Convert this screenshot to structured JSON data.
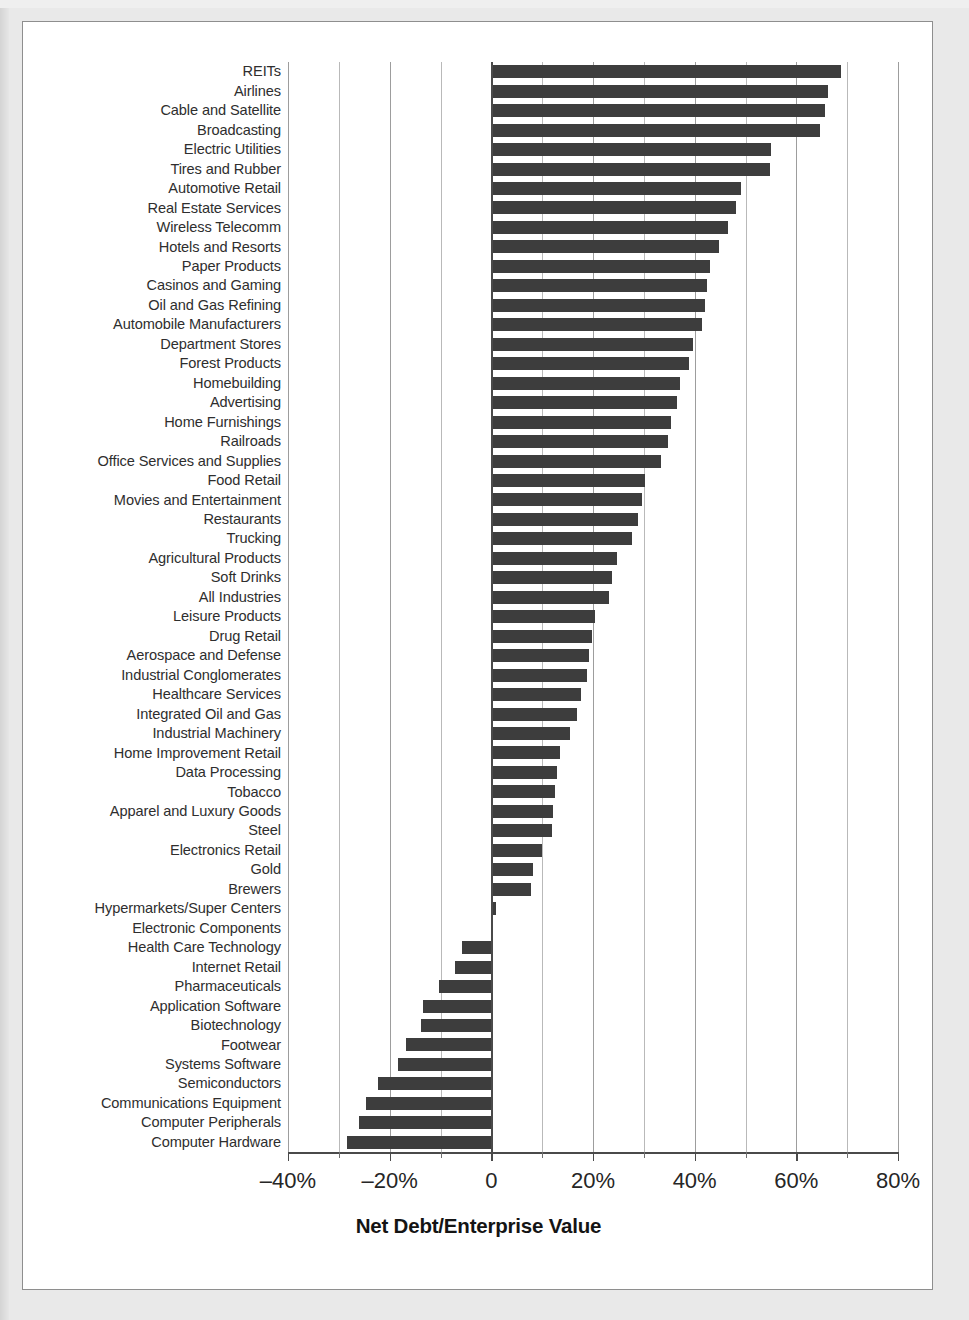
{
  "figure": {
    "axis_title": "Net Debt/Enterprise Value",
    "bar_color": "#3d3d3d",
    "frame_color": "#8e8e8e",
    "background": "#ffffff"
  },
  "chart_data": {
    "type": "bar",
    "orientation": "horizontal",
    "title": "",
    "xlabel": "Net Debt/Enterprise Value",
    "ylabel": "",
    "xlim": [
      -40,
      80
    ],
    "xticks": [
      -40,
      -20,
      0,
      20,
      40,
      60,
      80
    ],
    "xtick_labels": [
      "–40%",
      "–20%",
      "0",
      "20%",
      "40%",
      "60%",
      "80%"
    ],
    "minor_tick_interval": 10,
    "grid": true,
    "legend": null,
    "units": "percent",
    "categories": [
      "REITs",
      "Airlines",
      "Cable and Satellite",
      "Broadcasting",
      "Electric Utilities",
      "Tires and Rubber",
      "Automotive Retail",
      "Real Estate Services",
      "Wireless Telecomm",
      "Hotels and Resorts",
      "Paper Products",
      "Casinos and Gaming",
      "Oil and Gas Refining",
      "Automobile Manufacturers",
      "Department Stores",
      "Forest Products",
      "Homebuilding",
      "Advertising",
      "Home Furnishings",
      "Railroads",
      "Office Services and Supplies",
      "Food Retail",
      "Movies and Entertainment",
      "Restaurants",
      "Trucking",
      "Agricultural Products",
      "Soft Drinks",
      "All Industries",
      "Leisure Products",
      "Drug Retail",
      "Aerospace and Defense",
      "Industrial Conglomerates",
      "Healthcare Services",
      "Integrated Oil and Gas",
      "Industrial Machinery",
      "Home Improvement Retail",
      "Data Processing",
      "Tobacco",
      "Apparel and Luxury Goods",
      "Steel",
      "Electronics Retail",
      "Gold",
      "Brewers",
      "Hypermarkets/Super Centers",
      "Electronic Components",
      "Health Care Technology",
      "Internet Retail",
      "Pharmaceuticals",
      "Application Software",
      "Biotechnology",
      "Footwear",
      "Systems Software",
      "Semiconductors",
      "Communications Equipment",
      "Computer Peripherals",
      "Computer Hardware"
    ],
    "values": [
      68.8,
      66.3,
      65.6,
      64.6,
      55.1,
      54.9,
      49.2,
      48.2,
      46.5,
      44.7,
      43.1,
      42.5,
      42.1,
      41.5,
      39.6,
      38.8,
      37.2,
      36.6,
      35.4,
      34.8,
      33.4,
      30.3,
      29.6,
      28.9,
      27.6,
      24.8,
      23.7,
      23.1,
      20.3,
      19.8,
      19.3,
      18.9,
      17.6,
      16.9,
      15.4,
      13.5,
      13.0,
      12.6,
      12.2,
      11.9,
      9.9,
      8.1,
      7.8,
      1.0,
      0.4,
      -5.7,
      -7.1,
      -10.2,
      -13.5,
      -13.8,
      -16.7,
      -18.3,
      -22.2,
      -24.6,
      -26.0,
      -28.3
    ]
  }
}
